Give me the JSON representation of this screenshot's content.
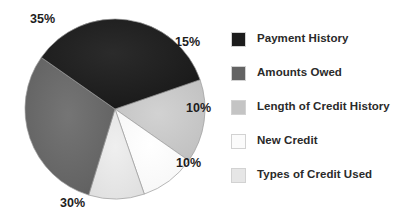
{
  "chart_data": {
    "type": "pie",
    "title": "",
    "subtitle": "",
    "xlabel": "",
    "ylabel": "",
    "legend_position": "right",
    "grid": false,
    "start_angle_deg": -19,
    "direction": "clockwise",
    "categories": [
      "Payment History",
      "Amounts Owed",
      "Length of Credit History",
      "New Credit",
      "Types of Credit Used"
    ],
    "values": [
      35,
      30,
      15,
      10,
      10
    ],
    "value_labels": [
      "35%",
      "30%",
      "15%",
      "10%",
      "10%"
    ],
    "colors": [
      "#1c1c1c",
      "#636363",
      "#c4c4c4",
      "#fbfbfb",
      "#e6e6e6"
    ],
    "slices": [
      {
        "label": "Payment History",
        "value": 35,
        "display": "35%",
        "color": "#1c1c1c"
      },
      {
        "label": "Amounts Owed",
        "value": 30,
        "display": "30%",
        "color": "#636363"
      },
      {
        "label": "Length of Credit History",
        "value": 15,
        "display": "15%",
        "color": "#c4c4c4"
      },
      {
        "label": "New Credit",
        "value": 10,
        "display": "10%",
        "color": "#fbfbfb"
      },
      {
        "label": "Types of Credit Used",
        "value": 10,
        "display": "10%",
        "color": "#e6e6e6"
      }
    ]
  },
  "pie": {
    "labels": {
      "pct_35": "35%",
      "pct_30": "30%",
      "pct_15": "15%",
      "pct_10_right": "10%",
      "pct_10_lower": "10%"
    }
  },
  "legend": {
    "items": [
      {
        "label": "Payment History",
        "color": "#1c1c1c"
      },
      {
        "label": "Amounts Owed",
        "color": "#636363"
      },
      {
        "label": "Length of Credit History",
        "color": "#c4c4c4"
      },
      {
        "label": "New Credit",
        "color": "#fbfbfb"
      },
      {
        "label": "Types of Credit Used",
        "color": "#e6e6e6"
      }
    ]
  }
}
